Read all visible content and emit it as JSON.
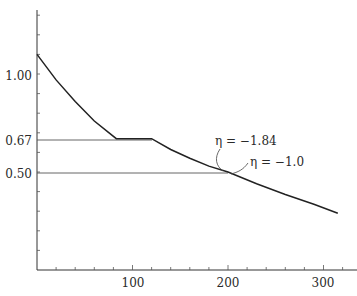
{
  "chart_data": {
    "type": "line",
    "title": "",
    "xlabel": "",
    "ylabel": "",
    "xlim": [
      0,
      330
    ],
    "ylim": [
      0,
      1.3
    ],
    "grid": false,
    "x_ticks": [
      100,
      200,
      300
    ],
    "x_tick_labels": [
      "100",
      "200",
      "300"
    ],
    "x_minor_step": 20,
    "y_tick_labels": [
      {
        "value": 1.0,
        "label": "1.00"
      },
      {
        "value": 0.67,
        "label": "0.67"
      },
      {
        "value": 0.5,
        "label": "0.50"
      }
    ],
    "y_minor_step": 0.1,
    "series": [
      {
        "name": "price curve",
        "x": [
          0,
          20,
          40,
          60,
          83,
          120,
          140,
          160,
          180,
          200,
          230,
          260,
          290,
          315
        ],
        "values": [
          1.1,
          0.97,
          0.86,
          0.76,
          0.67,
          0.67,
          0.615,
          0.57,
          0.53,
          0.5,
          0.44,
          0.385,
          0.335,
          0.29
        ]
      }
    ],
    "reference_lines": [
      {
        "y": 0.67,
        "x_from": 0,
        "x_to": 120,
        "label": "0.67"
      },
      {
        "y": 0.5,
        "x_from": 0,
        "x_to": 200,
        "label": "0.50"
      }
    ],
    "annotations": [
      {
        "text": "η = −1.84",
        "x": 200,
        "y": 0.5,
        "side": "left"
      },
      {
        "text": "η = −1.0",
        "x": 200,
        "y": 0.5,
        "side": "right"
      }
    ]
  },
  "labels": {
    "y_100": "1.00",
    "y_067": "0.67",
    "y_050": "0.50",
    "x_100": "100",
    "x_200": "200",
    "x_300": "300",
    "ann_elastic": "η = −1.84",
    "ann_unit": "η = −1.0"
  }
}
